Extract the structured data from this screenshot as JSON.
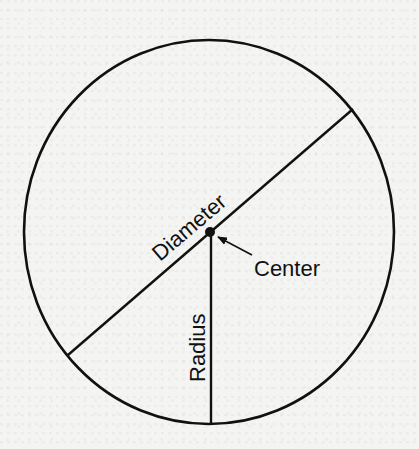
{
  "diagram": {
    "type": "circle-anatomy",
    "labels": {
      "diameter": "Diameter",
      "center": "Center",
      "radius": "Radius"
    },
    "geometry": {
      "circle": {
        "cx": 209,
        "cy": 232,
        "rx": 185,
        "ry": 192
      },
      "diameter_line": {
        "x1": 68,
        "y1": 355,
        "x2": 353,
        "y2": 109
      },
      "radius_line": {
        "x1": 211,
        "y1": 232,
        "x2": 211,
        "y2": 424
      },
      "center_point": {
        "x": 210,
        "y": 232
      }
    },
    "colors": {
      "stroke": "#111111",
      "background": "#f4f4f2"
    }
  }
}
